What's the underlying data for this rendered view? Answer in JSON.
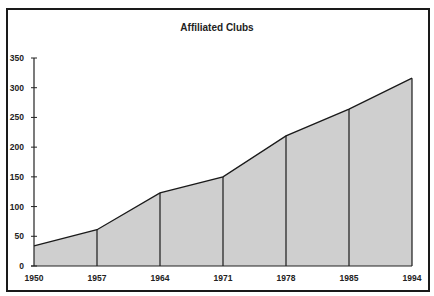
{
  "chart_data": {
    "type": "area",
    "title": "Affiliated Clubs",
    "xlabel": "",
    "ylabel": "",
    "categories": [
      "1950",
      "1957",
      "1964",
      "1971",
      "1978",
      "1985",
      "1994"
    ],
    "values": [
      34,
      61,
      123,
      150,
      219,
      264,
      316
    ],
    "series": [
      {
        "name": "Affiliated Clubs",
        "values": [
          34,
          61,
          123,
          150,
          219,
          264,
          316
        ]
      }
    ],
    "ylim": [
      0,
      350
    ],
    "yticks": [
      0,
      50,
      100,
      150,
      200,
      250,
      300,
      350
    ],
    "grid": false,
    "legend": "none",
    "drop_lines": true,
    "fill_color": "#cfcfcf",
    "line_color": "#1a1a1a"
  }
}
